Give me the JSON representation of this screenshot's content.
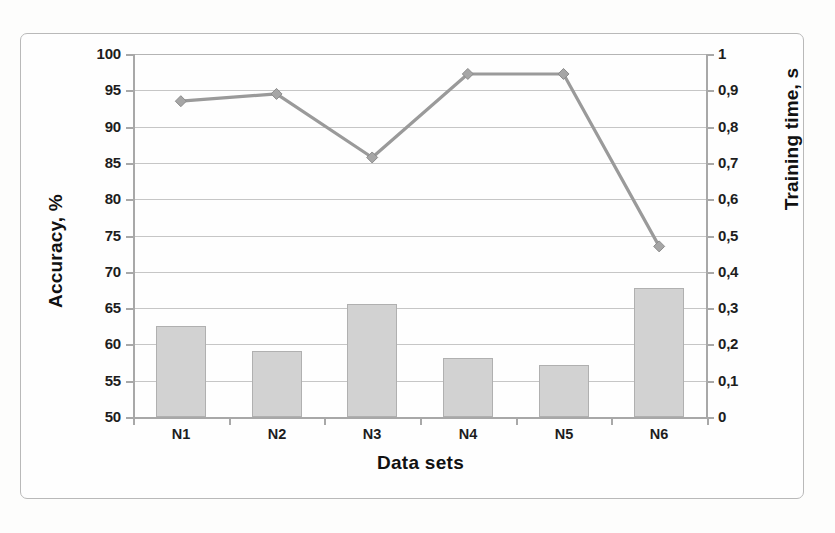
{
  "chart_data": {
    "type": "bar",
    "title": "",
    "categories": [
      "N1",
      "N2",
      "N3",
      "N4",
      "N5",
      "N6"
    ],
    "xlabel": "Data sets",
    "ylabel": "Accuracy, %",
    "y2label": "Training time, s",
    "ylim": [
      50,
      100
    ],
    "y2lim": [
      0,
      1
    ],
    "grid": true,
    "legend": "none",
    "decimal_separator": ",",
    "series": [
      {
        "name": "Accuracy, %",
        "type": "bar",
        "axis": "left",
        "color": "#d2d2d2",
        "values": [
          62.6,
          59.1,
          65.5,
          58.1,
          57.1,
          67.7
        ]
      },
      {
        "name": "Training time, s",
        "type": "line",
        "axis": "right",
        "color": "#9a9a9a",
        "marker": "diamond",
        "values": [
          0.87,
          0.89,
          0.715,
          0.945,
          0.945,
          0.47
        ]
      }
    ],
    "left_ticks": [
      "50",
      "55",
      "60",
      "65",
      "70",
      "75",
      "80",
      "85",
      "90",
      "95",
      "100"
    ],
    "right_ticks": [
      "0",
      "0,1",
      "0,2",
      "0,3",
      "0,4",
      "0,5",
      "0,6",
      "0,7",
      "0,8",
      "0,9",
      "1"
    ]
  }
}
